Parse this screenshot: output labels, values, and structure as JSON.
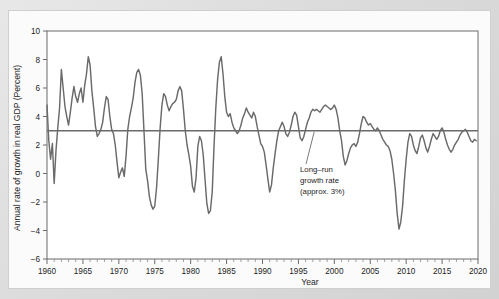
{
  "figure": {
    "background_color": "#ffffff",
    "frame_color": "#d8d8d8",
    "plot_bg": "#ffffff"
  },
  "annotation": {
    "line1": "Long–run",
    "line2": "growth rate",
    "line3": "(approx. 3%)"
  },
  "chart_data": {
    "type": "line",
    "title": "",
    "xlabel": "Year",
    "ylabel": "Annual rate of growth in real GDP (Percent)",
    "xlim": [
      1960,
      2020
    ],
    "ylim": [
      -6,
      10
    ],
    "xticks": [
      1960,
      1965,
      1970,
      1975,
      1980,
      1985,
      1990,
      1995,
      2000,
      2005,
      2010,
      2015,
      2020
    ],
    "xtick_labels": [
      "1960",
      "1965",
      "1970",
      "1975",
      "1980",
      "1985",
      "1990",
      "1995",
      "2000",
      "2005",
      "2010",
      "2015",
      "2020"
    ],
    "xtick_minor_step": 1,
    "yticks": [
      -6,
      -4,
      -2,
      0,
      2,
      4,
      6,
      8,
      10
    ],
    "ytick_labels": [
      "−6",
      "−4",
      "−2",
      "0",
      "2",
      "4",
      "6",
      "8",
      "10"
    ],
    "grid": false,
    "legend": "none",
    "series": [
      {
        "name": "Annual rate of growth in real GDP",
        "color": "#6a6a6a",
        "x": [
          1960.0,
          1960.25,
          1960.5,
          1960.75,
          1961.0,
          1961.25,
          1961.5,
          1961.75,
          1962.0,
          1962.25,
          1962.5,
          1962.75,
          1963.0,
          1963.25,
          1963.5,
          1963.75,
          1964.0,
          1964.25,
          1964.5,
          1964.75,
          1965.0,
          1965.25,
          1965.5,
          1965.75,
          1966.0,
          1966.25,
          1966.5,
          1966.75,
          1967.0,
          1967.25,
          1967.5,
          1967.75,
          1968.0,
          1968.25,
          1968.5,
          1968.75,
          1969.0,
          1969.25,
          1969.5,
          1969.75,
          1970.0,
          1970.25,
          1970.5,
          1970.75,
          1971.0,
          1971.25,
          1971.5,
          1971.75,
          1972.0,
          1972.25,
          1972.5,
          1972.75,
          1973.0,
          1973.25,
          1973.5,
          1973.75,
          1974.0,
          1974.25,
          1974.5,
          1974.75,
          1975.0,
          1975.25,
          1975.5,
          1975.75,
          1976.0,
          1976.25,
          1976.5,
          1976.75,
          1977.0,
          1977.25,
          1977.5,
          1977.75,
          1978.0,
          1978.25,
          1978.5,
          1978.75,
          1979.0,
          1979.25,
          1979.5,
          1979.75,
          1980.0,
          1980.25,
          1980.5,
          1980.75,
          1981.0,
          1981.25,
          1981.5,
          1981.75,
          1982.0,
          1982.25,
          1982.5,
          1982.75,
          1983.0,
          1983.25,
          1983.5,
          1983.75,
          1984.0,
          1984.25,
          1984.5,
          1984.75,
          1985.0,
          1985.25,
          1985.5,
          1985.75,
          1986.0,
          1986.25,
          1986.5,
          1986.75,
          1987.0,
          1987.25,
          1987.5,
          1987.75,
          1988.0,
          1988.25,
          1988.5,
          1988.75,
          1989.0,
          1989.25,
          1989.5,
          1989.75,
          1990.0,
          1990.25,
          1990.5,
          1990.75,
          1991.0,
          1991.25,
          1991.5,
          1991.75,
          1992.0,
          1992.25,
          1992.5,
          1992.75,
          1993.0,
          1993.25,
          1993.5,
          1993.75,
          1994.0,
          1994.25,
          1994.5,
          1994.75,
          1995.0,
          1995.25,
          1995.5,
          1995.75,
          1996.0,
          1996.25,
          1996.5,
          1996.75,
          1997.0,
          1997.25,
          1997.5,
          1997.75,
          1998.0,
          1998.25,
          1998.5,
          1998.75,
          1999.0,
          1999.25,
          1999.5,
          1999.75,
          2000.0,
          2000.25,
          2000.5,
          2000.75,
          2001.0,
          2001.25,
          2001.5,
          2001.75,
          2002.0,
          2002.25,
          2002.5,
          2002.75,
          2003.0,
          2003.25,
          2003.5,
          2003.75,
          2004.0,
          2004.25,
          2004.5,
          2004.75,
          2005.0,
          2005.25,
          2005.5,
          2005.75,
          2006.0,
          2006.25,
          2006.5,
          2006.75,
          2007.0,
          2007.25,
          2007.5,
          2007.75,
          2008.0,
          2008.25,
          2008.5,
          2008.75,
          2009.0,
          2009.25,
          2009.5,
          2009.75,
          2010.0,
          2010.25,
          2010.5,
          2010.75,
          2011.0,
          2011.25,
          2011.5,
          2011.75,
          2012.0,
          2012.25,
          2012.5,
          2012.75,
          2013.0,
          2013.25,
          2013.5,
          2013.75,
          2014.0,
          2014.25,
          2014.5,
          2014.75,
          2015.0,
          2015.25,
          2015.5,
          2015.75,
          2016.0,
          2016.25,
          2016.5,
          2016.75,
          2017.0,
          2017.25,
          2017.5,
          2017.75,
          2018.0,
          2018.25,
          2018.5,
          2018.75,
          2019.0,
          2019.25,
          2019.5,
          2019.75
        ],
        "y": [
          4.8,
          2.3,
          1.0,
          2.1,
          -0.7,
          1.6,
          3.2,
          4.6,
          7.3,
          6.0,
          4.7,
          4.0,
          3.4,
          4.3,
          5.3,
          6.1,
          5.4,
          5.0,
          5.6,
          6.0,
          5.0,
          6.2,
          7.0,
          8.2,
          7.6,
          5.8,
          4.6,
          3.3,
          2.6,
          2.8,
          3.1,
          3.6,
          4.6,
          5.4,
          5.2,
          4.0,
          3.1,
          2.8,
          2.0,
          0.8,
          -0.3,
          0.1,
          0.4,
          -0.2,
          1.2,
          3.1,
          4.0,
          4.6,
          5.3,
          6.4,
          7.1,
          7.3,
          6.9,
          5.6,
          3.0,
          0.3,
          -0.5,
          -1.6,
          -2.2,
          -2.5,
          -2.3,
          -1.0,
          1.0,
          3.2,
          4.8,
          5.6,
          5.4,
          4.8,
          4.4,
          4.7,
          4.9,
          5.0,
          5.2,
          5.8,
          6.1,
          5.8,
          4.5,
          3.0,
          2.0,
          1.3,
          0.5,
          -0.9,
          -1.3,
          -0.3,
          1.9,
          2.6,
          2.3,
          1.3,
          -0.4,
          -2.1,
          -2.8,
          -2.6,
          -1.3,
          1.9,
          4.6,
          6.6,
          7.8,
          8.2,
          7.0,
          5.4,
          4.3,
          4.0,
          4.2,
          3.6,
          3.2,
          3.0,
          2.8,
          3.0,
          3.4,
          3.9,
          4.2,
          4.6,
          4.3,
          4.1,
          3.9,
          4.3,
          4.0,
          3.3,
          2.7,
          2.1,
          1.9,
          1.5,
          0.6,
          -0.4,
          -1.3,
          -0.8,
          0.4,
          1.4,
          2.3,
          3.0,
          3.3,
          3.6,
          3.3,
          2.8,
          2.6,
          2.9,
          3.4,
          4.0,
          4.3,
          4.1,
          3.3,
          2.5,
          2.3,
          2.6,
          3.1,
          3.6,
          3.9,
          4.3,
          4.5,
          4.4,
          4.5,
          4.4,
          4.3,
          4.5,
          4.7,
          4.8,
          4.7,
          4.6,
          4.5,
          4.6,
          4.8,
          4.5,
          3.9,
          3.0,
          2.3,
          1.2,
          0.6,
          0.9,
          1.4,
          1.8,
          2.0,
          2.1,
          1.9,
          2.2,
          2.8,
          3.5,
          4.0,
          3.9,
          3.6,
          3.4,
          3.5,
          3.3,
          3.1,
          3.0,
          3.2,
          3.0,
          2.7,
          2.4,
          2.2,
          2.0,
          1.9,
          1.6,
          1.0,
          0.0,
          -1.2,
          -2.8,
          -3.9,
          -3.4,
          -2.3,
          -0.5,
          1.0,
          2.2,
          2.8,
          2.6,
          2.0,
          1.6,
          1.4,
          1.9,
          2.5,
          2.7,
          2.3,
          1.8,
          1.5,
          1.9,
          2.4,
          2.8,
          2.6,
          2.4,
          2.6,
          3.0,
          3.2,
          2.9,
          2.4,
          2.0,
          1.7,
          1.5,
          1.7,
          2.0,
          2.2,
          2.4,
          2.7,
          2.9,
          3.0,
          3.1,
          2.9,
          2.6,
          2.3,
          2.2,
          2.4,
          2.3
        ]
      }
    ],
    "reference_line": {
      "label": "Long-run growth rate (approx. 3%)",
      "value": 3.0,
      "color": "#6a6a6a"
    },
    "recession_bands": [
      {
        "start": 1960.3,
        "end": 1961.15
      },
      {
        "start": 1969.9,
        "end": 1970.85
      },
      {
        "start": 1973.9,
        "end": 1975.2
      },
      {
        "start": 1980.1,
        "end": 1980.55
      },
      {
        "start": 1981.5,
        "end": 1982.85
      },
      {
        "start": 1990.5,
        "end": 1991.2
      },
      {
        "start": 2001.2,
        "end": 2001.9
      },
      {
        "start": 2007.9,
        "end": 2009.45
      }
    ],
    "recession_band_color": "#d9d9d9"
  }
}
